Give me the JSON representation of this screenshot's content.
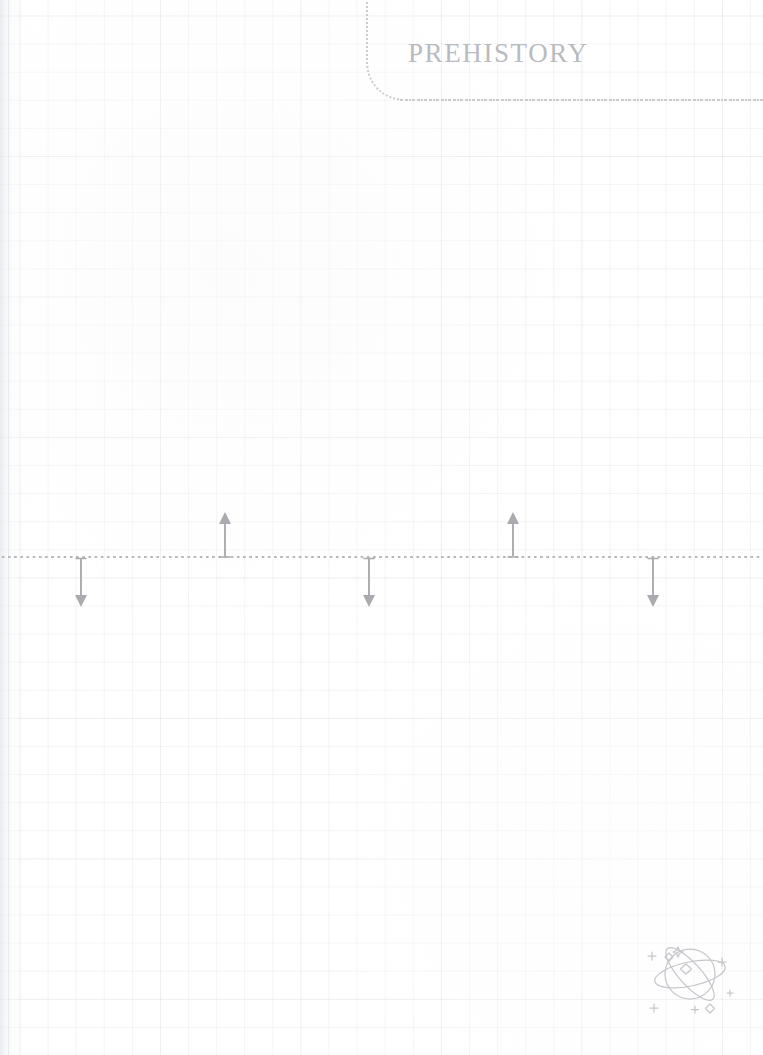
{
  "page": {
    "width": 763,
    "height": 1055,
    "background": "#ffffff",
    "paper_style": "graph-grid-notebook",
    "grid_cell_px": 28,
    "grid_line_color": "#eef0f2"
  },
  "title_card": {
    "title": "PREHISTORY",
    "title_color": "#b9bbbf",
    "border_style": "dotted",
    "border_color": "#c9cbcf",
    "corner": "bottom-left-rounded"
  },
  "timeline": {
    "axis_style": "dotted",
    "axis_color": "#b6b8bc",
    "axis_y": 556,
    "marker_color": "#a9abaf",
    "markers": [
      {
        "name": "marker-1",
        "x": 81,
        "direction": "down",
        "length": 50
      },
      {
        "name": "marker-2",
        "x": 225,
        "direction": "up",
        "length": 45
      },
      {
        "name": "marker-3",
        "x": 369,
        "direction": "down",
        "length": 50
      },
      {
        "name": "marker-4",
        "x": 513,
        "direction": "up",
        "length": 45
      },
      {
        "name": "marker-5",
        "x": 653,
        "direction": "down",
        "length": 50
      }
    ]
  },
  "decoration": {
    "icon": "planet-icon",
    "description": "planet with orbital rings and sparkles",
    "color": "#c5c7cb"
  },
  "chart_data": {
    "type": "timeline",
    "title": "PREHISTORY",
    "axis": "dotted horizontal line",
    "xlabel": "",
    "ylabel": "",
    "entries": [
      {
        "x": 81,
        "direction": "down",
        "label": ""
      },
      {
        "x": 225,
        "direction": "up",
        "label": ""
      },
      {
        "x": 369,
        "direction": "down",
        "label": ""
      },
      {
        "x": 513,
        "direction": "up",
        "label": ""
      },
      {
        "x": 653,
        "direction": "down",
        "label": ""
      }
    ]
  }
}
